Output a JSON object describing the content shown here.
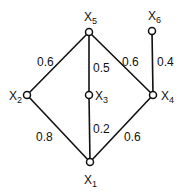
{
  "diagram": {
    "nodes": [
      {
        "id": "x1",
        "name": "X",
        "sub": "1",
        "x": 90,
        "y": 162
      },
      {
        "id": "x2",
        "name": "X",
        "sub": "2",
        "x": 27,
        "y": 95
      },
      {
        "id": "x3",
        "name": "X",
        "sub": "3",
        "x": 89,
        "y": 95
      },
      {
        "id": "x4",
        "name": "X",
        "sub": "4",
        "x": 153,
        "y": 95
      },
      {
        "id": "x5",
        "name": "X",
        "sub": "5",
        "x": 89,
        "y": 32
      },
      {
        "id": "x6",
        "name": "X",
        "sub": "6",
        "x": 152,
        "y": 31
      }
    ],
    "edges": [
      {
        "from": "x5",
        "to": "x2",
        "weight": "0.6"
      },
      {
        "from": "x5",
        "to": "x3",
        "weight": "0.5"
      },
      {
        "from": "x5",
        "to": "x4",
        "weight": "0.6"
      },
      {
        "from": "x6",
        "to": "x4",
        "weight": "0.4"
      },
      {
        "from": "x2",
        "to": "x1",
        "weight": "0.8"
      },
      {
        "from": "x3",
        "to": "x1",
        "weight": "0.2"
      },
      {
        "from": "x4",
        "to": "x1",
        "weight": "0.6"
      }
    ]
  }
}
